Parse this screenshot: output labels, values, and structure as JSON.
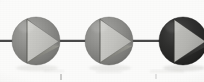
{
  "figure": {
    "type": "illustration",
    "width": 204,
    "height": 82,
    "background_color": "#fbfbfa"
  },
  "axis": {
    "line": {
      "label": "connecting string",
      "color": "#4a4a4a",
      "y": 41,
      "x_start": 0,
      "x_end": 204,
      "thickness": 2
    },
    "ticks": [
      {
        "label": "tick-left",
        "x": 61,
        "y": 74,
        "height": 6,
        "color": "#9a9a9a"
      },
      {
        "label": "tick-right",
        "x": 156,
        "y": 74,
        "height": 5,
        "color": "#b0b0b0"
      }
    ]
  },
  "beads": [
    {
      "name": "bead-1",
      "index": 1,
      "cx": 36,
      "cy": 41,
      "r": 24,
      "body_color": "#8d8d8a",
      "body_color_light": "#a3a3a0",
      "body_color_dark": "#6e6e6c",
      "triangle_color": "#c6c6c2",
      "triangle_shadow_color": "#7b7b78",
      "triangle_edge_color": "#5d5d5b",
      "shape": "right-triangle",
      "tone": "medium-gray"
    },
    {
      "name": "bead-2",
      "index": 2,
      "cx": 109,
      "cy": 41,
      "r": 24,
      "body_color": "#8d8d8a",
      "body_color_light": "#a3a3a0",
      "body_color_dark": "#6e6e6c",
      "triangle_color": "#c6c6c2",
      "triangle_shadow_color": "#7b7b78",
      "triangle_edge_color": "#5d5d5b",
      "shape": "right-triangle",
      "tone": "medium-gray"
    },
    {
      "name": "bead-3",
      "index": 3,
      "cx": 183,
      "cy": 41,
      "r": 24,
      "body_color": "#2e2e2d",
      "body_color_light": "#434342",
      "body_color_dark": "#1c1c1b",
      "triangle_color": "#b9b9b5",
      "triangle_shadow_color": "#6d6d6a",
      "triangle_edge_color": "#4a4a48",
      "shape": "right-triangle",
      "tone": "dark-gray"
    }
  ]
}
